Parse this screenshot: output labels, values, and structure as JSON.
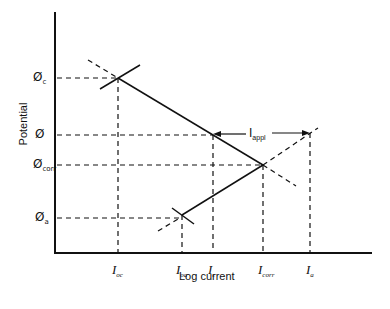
{
  "diagram": {
    "type": "Evans polarization diagram",
    "axes": {
      "y_label": "Potential",
      "x_label": "Log current"
    },
    "y_ticks": [
      {
        "symbol": "Ø",
        "sub": "c"
      },
      {
        "symbol": "Ø",
        "sub": ""
      },
      {
        "symbol": "Ø",
        "sub": "corr"
      },
      {
        "symbol": "Ø",
        "sub": "a"
      }
    ],
    "x_ticks": [
      {
        "symbol": "I",
        "sub": "oc"
      },
      {
        "symbol": "I",
        "sub": "oa"
      },
      {
        "symbol": "I",
        "sub": "c"
      },
      {
        "symbol": "I",
        "sub": "corr"
      },
      {
        "symbol": "I",
        "sub": "a"
      }
    ],
    "annotation": {
      "symbol": "I",
      "sub": "appl"
    },
    "colors": {
      "line": "#111111",
      "background": "#ffffff"
    }
  }
}
